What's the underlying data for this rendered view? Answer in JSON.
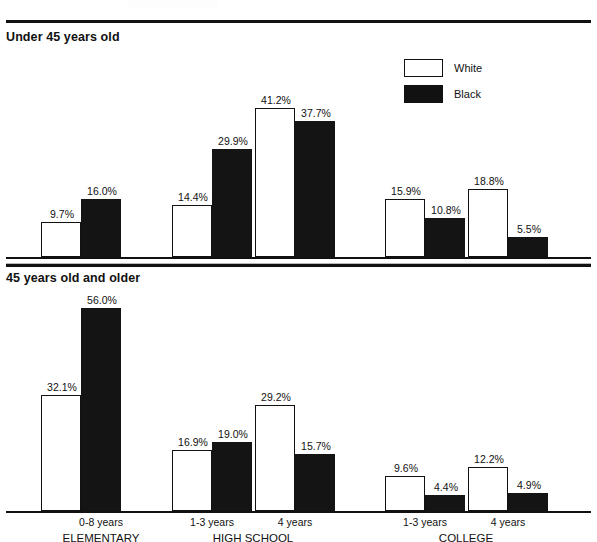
{
  "legend": {
    "items": [
      {
        "label": "White",
        "color": "#ffffff",
        "swatch": "white"
      },
      {
        "label": "Black",
        "color": "#111111",
        "swatch": "black"
      }
    ]
  },
  "sections": {
    "top_title": "Under 45 years old",
    "bottom_title": "45 years old and older"
  },
  "axis": {
    "ticks": [
      "0-8 years",
      "1-3 years",
      "4 years",
      "1-3 years",
      "4 years"
    ],
    "groups": [
      "ELEMENTARY",
      "HIGH SCHOOL",
      "COLLEGE"
    ]
  },
  "chart_data": [
    {
      "type": "bar",
      "title": "Under 45 years old",
      "xlabel": "",
      "ylabel": "",
      "ylim": [
        0,
        56
      ],
      "grid": false,
      "legend_position": "top-right",
      "categories": [
        "0-8 years",
        "1-3 years",
        "4 years",
        "1-3 years",
        "4 years"
      ],
      "category_groups": [
        "ELEMENTARY",
        "HIGH SCHOOL",
        "HIGH SCHOOL",
        "COLLEGE",
        "COLLEGE"
      ],
      "series": [
        {
          "name": "White",
          "values": [
            9.7,
            14.4,
            41.2,
            15.9,
            18.8
          ],
          "labels": [
            "9.7%",
            "14.4%",
            "41.2%",
            "15.9%",
            "18.8%"
          ]
        },
        {
          "name": "Black",
          "values": [
            16.0,
            29.9,
            37.7,
            10.8,
            5.5
          ],
          "labels": [
            "16.0%",
            "29.9%",
            "37.7%",
            "10.8%",
            "5.5%"
          ]
        }
      ]
    },
    {
      "type": "bar",
      "title": "45 years old and older",
      "xlabel": "",
      "ylabel": "",
      "ylim": [
        0,
        56
      ],
      "grid": false,
      "legend_position": "none",
      "categories": [
        "0-8 years",
        "1-3 years",
        "4 years",
        "1-3 years",
        "4 years"
      ],
      "category_groups": [
        "ELEMENTARY",
        "HIGH SCHOOL",
        "HIGH SCHOOL",
        "COLLEGE",
        "COLLEGE"
      ],
      "series": [
        {
          "name": "White",
          "values": [
            32.1,
            16.9,
            29.2,
            9.6,
            12.2
          ],
          "labels": [
            "32.1%",
            "16.9%",
            "29.2%",
            "9.6%",
            "12.2%"
          ]
        },
        {
          "name": "Black",
          "values": [
            56.0,
            19.0,
            15.7,
            4.4,
            4.9
          ],
          "labels": [
            "56.0%",
            "19.0%",
            "15.7%",
            "4.4%",
            "4.9%"
          ]
        }
      ]
    }
  ],
  "layout": {
    "bar_width": 40,
    "group_x": [
      41,
      172,
      255,
      385,
      468
    ],
    "px_per_percent": 3.62,
    "top_baseline_y": 212,
    "bottom_baseline_y": 221,
    "tick_centers": [
      101,
      212,
      295,
      425,
      508
    ],
    "group_centers": [
      101,
      253,
      466
    ]
  }
}
